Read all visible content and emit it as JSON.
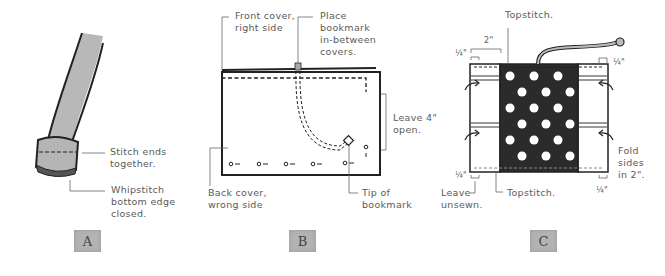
{
  "panels": [
    {
      "id": "A",
      "label": "A",
      "callouts": {
        "stitch_ends": "Stitch ends\ntogether.",
        "whipstitch": "Whipstitch\nbottom edge\nclosed."
      }
    },
    {
      "id": "B",
      "label": "B",
      "callouts": {
        "front_cover": "Front cover,\nright side",
        "place_bookmark": "Place\nbookmark\nin-between\ncovers.",
        "leave_open": "Leave 4\"\nopen.",
        "back_cover": "Back cover,\nwrong side",
        "tip": "Tip of\nbookmark"
      }
    },
    {
      "id": "C",
      "label": "C",
      "callouts": {
        "topstitch_top": "Topstitch.",
        "dim_2in": "2\"",
        "quarter_tl": "¼\"",
        "quarter_tr": "¼\"",
        "quarter_bl": "¼\"",
        "quarter_br": "¼\"",
        "leave_unsewn": "Leave\nunsewn.",
        "topstitch_bottom": "Topstitch.",
        "fold_sides": "Fold\nsides\nin 2\"."
      }
    }
  ],
  "colors": {
    "line": "#222222",
    "strap_fill": "#b8b8b8",
    "fabric_dark": "#2b2b2b",
    "dot": "#ffffff",
    "stripe": "#9a9a9a",
    "leader": "#666666",
    "tile": "#b3b3b3"
  }
}
